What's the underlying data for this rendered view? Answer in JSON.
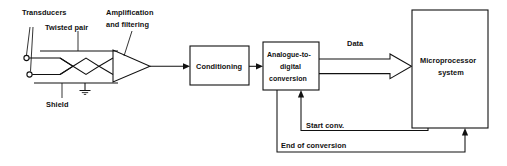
{
  "diagram": {
    "background_color": "#ffffff",
    "line_color": "#111111",
    "labels": {
      "transducers": "Transducers",
      "twisted_pair": "Twisted pair",
      "shield": "Shield",
      "amplification": "Amplification",
      "filtering": "and filtering",
      "data": "Data",
      "start_conversion": "Start conv.",
      "end_of_conversion": "End of conversion"
    },
    "blocks": [
      {
        "id": "conditioning",
        "lines": [
          "Conditioning"
        ],
        "x": 190,
        "y": 46,
        "w": 59,
        "h": 39
      },
      {
        "id": "adc",
        "lines": [
          "Analogue-to-",
          "digital",
          "conversion"
        ],
        "x": 263,
        "y": 42,
        "w": 56,
        "h": 48
      },
      {
        "id": "microprocessor",
        "lines": [
          "Microprocessor",
          "system"
        ],
        "x": 412,
        "y": 10,
        "w": 76,
        "h": 118
      }
    ],
    "symbols": {
      "amplifier": "amplifier-triangle",
      "ground": "ground-symbol",
      "terminal_top": "transducer-terminal",
      "terminal_bottom": "transducer-terminal"
    }
  }
}
